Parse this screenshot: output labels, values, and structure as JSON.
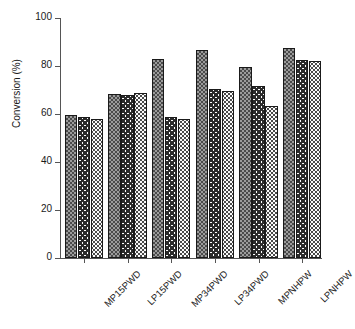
{
  "chart_data": {
    "type": "bar",
    "title": "",
    "xlabel": "",
    "ylabel": "Conversion (%)",
    "ylim": [
      0,
      100
    ],
    "yticks": [
      0,
      20,
      40,
      60,
      80,
      100
    ],
    "ytick_labels": [
      "0",
      "20",
      "40",
      "60",
      "80",
      "100"
    ],
    "grid": false,
    "legend": "none",
    "categories": [
      "MP15PWD",
      "LP15PWD",
      "MP34PWD",
      "LP34PWD",
      "MPNHPW",
      "LPNHPW"
    ],
    "series": [
      {
        "name": "series-1",
        "pattern": "dense-checker",
        "values": [
          59.7,
          68.5,
          82.8,
          86.5,
          79.6,
          87.4
        ]
      },
      {
        "name": "series-2",
        "pattern": "wavy-lines",
        "values": [
          58.8,
          67.8,
          58.8,
          70.5,
          71.5,
          82.3
        ]
      },
      {
        "name": "series-3",
        "pattern": "sparse-dots",
        "values": [
          57.8,
          68.6,
          57.8,
          69.5,
          63.5,
          82.2
        ]
      }
    ]
  },
  "colors": {
    "axis": "#555555",
    "text": "#1a1a1a",
    "bar_outline": "#1a1a1a",
    "background": "#ffffff"
  }
}
